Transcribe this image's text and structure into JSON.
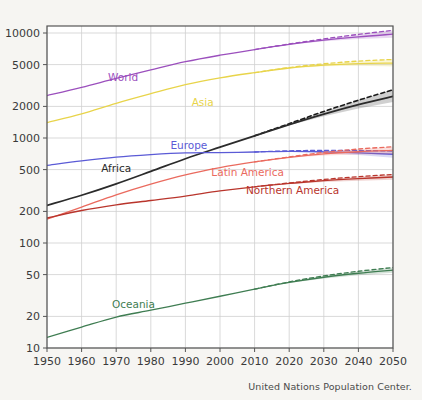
{
  "caption": "United Nations Population Center.",
  "chart_data": {
    "type": "line",
    "title": "",
    "xlabel": "",
    "ylabel": "",
    "yscale": "log",
    "ylim": [
      10,
      12000
    ],
    "xlim": [
      1950,
      2050
    ],
    "grid": true,
    "legend_position": "inline-labels",
    "yticks": [
      10,
      20,
      50,
      100,
      200,
      500,
      1000,
      2000,
      5000,
      10000
    ],
    "ytick_labels": [
      "10",
      "20",
      "50",
      "100",
      "200",
      "500",
      "1000",
      "2000",
      "5000",
      "10000"
    ],
    "xticks": [
      1950,
      1960,
      1970,
      1980,
      1990,
      2000,
      2010,
      2020,
      2030,
      2040,
      2050
    ],
    "xtick_labels": [
      "1950",
      "1960",
      "1970",
      "1980",
      "1990",
      "2000",
      "2010",
      "2020",
      "2030",
      "2040",
      "2050"
    ],
    "x": [
      1950,
      1960,
      1970,
      1980,
      1990,
      2000,
      2010,
      2020,
      2030,
      2040,
      2050
    ],
    "projection_start": 2010,
    "units": "millions",
    "series": [
      {
        "name": "World",
        "color": "#9b4fbd",
        "label": "World",
        "label_x": 1972,
        "label_y": 3500,
        "values": [
          2536,
          3035,
          3700,
          4458,
          5331,
          6145,
          6958,
          7795,
          8548,
          9199,
          9735
        ],
        "projection_high": [
          null,
          null,
          null,
          null,
          null,
          null,
          6958,
          7860,
          8780,
          9700,
          10600
        ],
        "band_low": [
          null,
          null,
          null,
          null,
          null,
          null,
          6958,
          7730,
          8330,
          8750,
          8990
        ]
      },
      {
        "name": "Asia",
        "color": "#e8d44a",
        "label": "Asia",
        "label_x": 1995,
        "label_y": 2000,
        "values": [
          1404,
          1700,
          2142,
          2642,
          3226,
          3741,
          4194,
          4641,
          4947,
          5115,
          5160
        ],
        "projection_high": [
          null,
          null,
          null,
          null,
          null,
          null,
          4194,
          4690,
          5090,
          5400,
          5600
        ],
        "band_low": [
          null,
          null,
          null,
          null,
          null,
          null,
          4194,
          4600,
          4820,
          4870,
          4790
        ]
      },
      {
        "name": "Africa",
        "color": "#2b2b2b",
        "label": "Africa",
        "label_x": 1970,
        "label_y": 470,
        "values": [
          228,
          285,
          366,
          481,
          635,
          818,
          1049,
          1341,
          1688,
          2077,
          2489
        ],
        "projection_high": [
          null,
          null,
          null,
          null,
          null,
          null,
          1049,
          1370,
          1790,
          2290,
          2880
        ],
        "band_low": [
          null,
          null,
          null,
          null,
          null,
          null,
          1049,
          1320,
          1610,
          1910,
          2200
        ]
      },
      {
        "name": "Europe",
        "color": "#5b5bd6",
        "label": "Europe",
        "label_x": 1991,
        "label_y": 790,
        "values": [
          549,
          605,
          657,
          694,
          721,
          726,
          736,
          747,
          739,
          723,
          700
        ],
        "projection_high": [
          null,
          null,
          null,
          null,
          null,
          null,
          736,
          755,
          762,
          760,
          752
        ],
        "band_low": [
          null,
          null,
          null,
          null,
          null,
          null,
          736,
          740,
          718,
          687,
          650
        ]
      },
      {
        "name": "Latin America",
        "color": "#ea6a5e",
        "label": "Latin America",
        "label_x": 2008,
        "label_y": 430,
        "values": [
          169,
          220,
          288,
          364,
          446,
          522,
          591,
          654,
          706,
          740,
          762
        ],
        "projection_high": [
          null,
          null,
          null,
          null,
          null,
          null,
          591,
          661,
          730,
          785,
          825
        ],
        "band_low": [
          null,
          null,
          null,
          null,
          null,
          null,
          591,
          648,
          683,
          698,
          700
        ]
      },
      {
        "name": "Northern America",
        "color": "#b9352c",
        "label": "Northern America",
        "label_x": 2021,
        "label_y": 290,
        "values": [
          173,
          204,
          231,
          254,
          280,
          313,
          343,
          369,
          392,
          410,
          425
        ],
        "projection_high": [
          null,
          null,
          null,
          null,
          null,
          null,
          343,
          373,
          403,
          428,
          450
        ],
        "band_low": [
          null,
          null,
          null,
          null,
          null,
          null,
          343,
          365,
          382,
          392,
          400
        ]
      },
      {
        "name": "Oceania",
        "color": "#3f7d52",
        "label": "Oceania",
        "label_x": 1975,
        "label_y": 24,
        "values": [
          12.6,
          15.8,
          19.7,
          22.9,
          26.7,
          31.1,
          36.4,
          42.1,
          47.2,
          51.5,
          55.2
        ],
        "projection_high": [
          null,
          null,
          null,
          null,
          null,
          null,
          36.4,
          42.6,
          48.6,
          53.8,
          58.4
        ],
        "band_low": [
          null,
          null,
          null,
          null,
          null,
          null,
          36.4,
          41.6,
          45.8,
          49.2,
          52.0
        ]
      }
    ]
  }
}
